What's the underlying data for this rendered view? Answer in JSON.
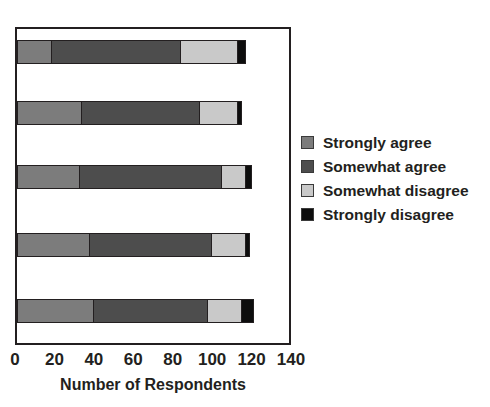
{
  "chart_data": {
    "type": "bar",
    "orientation": "horizontal",
    "stacked": true,
    "title": "",
    "xlabel": "Number of Respondents",
    "ylabel": "",
    "xlim": [
      0,
      140
    ],
    "xticks": [
      0,
      20,
      40,
      60,
      80,
      100,
      120,
      140
    ],
    "grid": false,
    "legend_position": "right",
    "categories": [
      "Item 1",
      "Item 2",
      "Item 3",
      "Item 4",
      "Item 5"
    ],
    "series": [
      {
        "name": "Strongly agree",
        "color": "#7c7c7c",
        "values": [
          18,
          33,
          32,
          37,
          39
        ]
      },
      {
        "name": "Somewhat agree",
        "color": "#4d4d4d",
        "values": [
          65,
          60,
          72,
          62,
          58
        ]
      },
      {
        "name": "Somewhat disagree",
        "color": "#c9c9c9",
        "values": [
          29,
          19,
          12,
          17,
          17
        ]
      },
      {
        "name": "Strongly disagree",
        "color": "#0d0d0d",
        "values": [
          4,
          2,
          3,
          2,
          6
        ]
      }
    ],
    "totals": [
      116,
      114,
      119,
      118,
      120
    ]
  },
  "axis": {
    "tick_labels": [
      "0",
      "20",
      "40",
      "60",
      "80",
      "100",
      "120",
      "140"
    ],
    "x_axis_title": "Number of Respondents"
  },
  "legend": {
    "items": [
      {
        "label": "Strongly agree",
        "color": "#7c7c7c"
      },
      {
        "label": "Somewhat agree",
        "color": "#4d4d4d"
      },
      {
        "label": "Somewhat disagree",
        "color": "#c9c9c9"
      },
      {
        "label": "Strongly disagree",
        "color": "#0d0d0d"
      }
    ]
  }
}
